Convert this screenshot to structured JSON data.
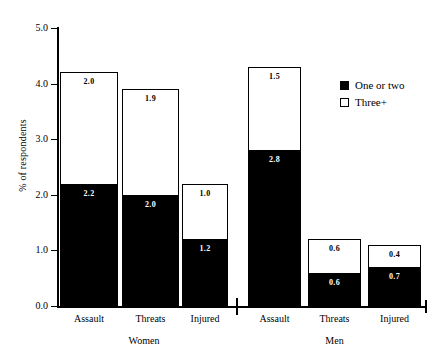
{
  "top_clipped_text": "",
  "legend": {
    "position": "top-right",
    "items": [
      {
        "label": "One or two",
        "swatch": "filled-black-square",
        "color": "#000000"
      },
      {
        "label": "Three+",
        "swatch": "open-white-square",
        "color": "#ffffff"
      }
    ]
  },
  "axes": {
    "ylabel": "% of respondents",
    "yticks": [
      "0.0",
      "1.0",
      "2.0",
      "3.0",
      "4.0",
      "5.0"
    ],
    "ytick_values": [
      0.0,
      1.0,
      2.0,
      3.0,
      4.0,
      5.0
    ],
    "ylim": [
      0.0,
      5.0
    ],
    "xlabel": ""
  },
  "groups": [
    {
      "name": "Women",
      "categories": [
        "Assault",
        "Threats",
        "Injured"
      ]
    },
    {
      "name": "Men",
      "categories": [
        "Assault",
        "Threats",
        "Injured"
      ]
    }
  ],
  "chart_data": {
    "type": "bar",
    "subtype": "stacked-bar",
    "title": "",
    "xlabel": "",
    "ylabel": "% of respondents",
    "ylim": [
      0.0,
      5.0
    ],
    "yticks": [
      0.0,
      1.0,
      2.0,
      3.0,
      4.0,
      5.0
    ],
    "grid": false,
    "legend_position": "top-right",
    "group_labels": [
      "Women",
      "Men"
    ],
    "categories": [
      "Women / Assault",
      "Women / Threats",
      "Women / Injured",
      "Men / Assault",
      "Men / Threats",
      "Men / Injured"
    ],
    "series": [
      {
        "name": "One or two",
        "color": "#000000",
        "values": [
          2.2,
          2.0,
          1.2,
          2.8,
          0.6,
          0.7
        ]
      },
      {
        "name": "Three+",
        "color": "#ffffff",
        "values": [
          2.0,
          1.9,
          1.0,
          1.5,
          0.6,
          0.4
        ]
      }
    ],
    "totals": [
      4.2,
      3.9,
      2.2,
      4.3,
      1.2,
      1.1
    ]
  },
  "bars": [
    {
      "key": "women-assault",
      "group": "Women",
      "category": "Assault",
      "dark_label": "2.2",
      "light_label": "2.0",
      "dark_value": 2.2,
      "light_value": 2.0,
      "total": 4.2
    },
    {
      "key": "women-threats",
      "group": "Women",
      "category": "Threats",
      "dark_label": "2.0",
      "light_label": "1.9",
      "dark_value": 2.0,
      "light_value": 1.9,
      "total": 3.9
    },
    {
      "key": "women-injured",
      "group": "Women",
      "category": "Injured",
      "dark_label": "1.2",
      "light_label": "1.0",
      "dark_value": 1.2,
      "light_value": 1.0,
      "total": 2.2
    },
    {
      "key": "men-assault",
      "group": "Men",
      "category": "Assault",
      "dark_label": "2.8",
      "light_label": "1.5",
      "dark_value": 2.8,
      "light_value": 1.5,
      "total": 4.3
    },
    {
      "key": "men-threats",
      "group": "Men",
      "category": "Threats",
      "dark_label": "0.6",
      "light_label": "0.6",
      "dark_value": 0.6,
      "light_value": 0.6,
      "total": 1.2
    },
    {
      "key": "men-injured",
      "group": "Men",
      "category": "Injured",
      "dark_label": "0.7",
      "light_label": "0.4",
      "dark_value": 0.7,
      "light_value": 0.4,
      "total": 1.1
    }
  ]
}
